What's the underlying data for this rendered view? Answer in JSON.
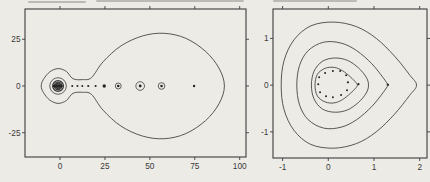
{
  "figure": {
    "background": "#edebe6",
    "ink": "#3c3c3c",
    "dot_color": "#262626",
    "label_color": "#3a3a3a",
    "panel_count": 2
  },
  "chart_data": [
    {
      "id": "left",
      "type": "contour+scatter",
      "title": "",
      "xlabel": "",
      "ylabel": "",
      "xlim": [
        -19.5,
        103.5
      ],
      "ylim": [
        -38.0,
        41.2
      ],
      "x_ticks": [
        0,
        25,
        50,
        75,
        100
      ],
      "y_ticks": [
        -25,
        0,
        25
      ],
      "grid": false,
      "legend": null,
      "contours": [
        {
          "name": "outer-lemniscate",
          "sw": 0.85,
          "points": [
            [
              7.2,
              3.9
            ],
            [
              3.5,
              7.8
            ],
            [
              -1.1,
              9.3
            ],
            [
              -5.8,
              7.5
            ],
            [
              -9.3,
              3.4
            ],
            [
              -10.5,
              0
            ],
            [
              -9.3,
              -3.4
            ],
            [
              -5.8,
              -7.5
            ],
            [
              -1.1,
              -9.3
            ],
            [
              3.5,
              -7.8
            ],
            [
              7.2,
              -3.9
            ],
            [
              12.5,
              -3.4
            ],
            [
              17.5,
              -4.5
            ],
            [
              24,
              -13
            ],
            [
              34,
              -21.5
            ],
            [
              46,
              -26.8
            ],
            [
              58,
              -28.2
            ],
            [
              70,
              -25.5
            ],
            [
              81,
              -18.5
            ],
            [
              88.5,
              -9.5
            ],
            [
              91.5,
              0
            ],
            [
              88.5,
              9.5
            ],
            [
              81,
              18.5
            ],
            [
              70,
              25.5
            ],
            [
              58,
              28.2
            ],
            [
              46,
              26.8
            ],
            [
              34,
              21.5
            ],
            [
              24,
              13
            ],
            [
              17.5,
              4.5
            ],
            [
              12.5,
              3.4
            ]
          ]
        }
      ],
      "circles": [
        {
          "c": [
            -1.1,
            0
          ],
          "r": 4.6,
          "sw": 0.8
        },
        {
          "c": [
            -1.1,
            0
          ],
          "r": 3.0,
          "sw": 1.3
        },
        {
          "c": [
            -1.1,
            0
          ],
          "r": 2.1,
          "sw": 1.3
        },
        {
          "c": [
            -1.1,
            0
          ],
          "r": 1.35,
          "sw": 1.4
        },
        {
          "c": [
            32.4,
            0
          ],
          "r": 1.65,
          "sw": 0.8
        },
        {
          "c": [
            44.6,
            0
          ],
          "r": 2.4,
          "sw": 0.8
        },
        {
          "c": [
            56.5,
            0
          ],
          "r": 1.85,
          "sw": 0.8
        }
      ],
      "filled": [
        {
          "c": [
            -1.3,
            0
          ],
          "rx": 2.9,
          "ry": 0.95
        }
      ],
      "points": [
        {
          "x": 6.8,
          "y": 0,
          "r": 1.0
        },
        {
          "x": 9.7,
          "y": 0,
          "r": 1.0
        },
        {
          "x": 12.4,
          "y": 0,
          "r": 1.0
        },
        {
          "x": 15.7,
          "y": 0,
          "r": 1.1
        },
        {
          "x": 19.8,
          "y": 0,
          "r": 1.1
        },
        {
          "x": 24.6,
          "y": 0,
          "r": 1.7
        },
        {
          "x": 32.4,
          "y": 0,
          "r": 1.3
        },
        {
          "x": 44.6,
          "y": 0,
          "r": 1.4
        },
        {
          "x": 56.5,
          "y": 0,
          "r": 1.3
        },
        {
          "x": 74.6,
          "y": 0,
          "r": 1.2
        }
      ]
    },
    {
      "id": "right",
      "type": "contour+scatter",
      "title": "",
      "xlabel": "",
      "ylabel": "",
      "xlim": [
        -1.21,
        2.16
      ],
      "ylim": [
        -1.56,
        1.63
      ],
      "x_ticks": [
        -1,
        0,
        1,
        2
      ],
      "y_ticks": [
        -1,
        0,
        1
      ],
      "grid": false,
      "legend": null,
      "contours": [
        {
          "name": "level-1-outer",
          "sw": 0.85,
          "points": [
            [
              -1.03,
              0
            ],
            [
              -0.97,
              0.52
            ],
            [
              -0.75,
              0.97
            ],
            [
              -0.38,
              1.27
            ],
            [
              0.12,
              1.35
            ],
            [
              0.62,
              1.25
            ],
            [
              1.05,
              1.0
            ],
            [
              1.45,
              0.62
            ],
            [
              1.78,
              0.22
            ],
            [
              1.93,
              0
            ],
            [
              1.78,
              -0.22
            ],
            [
              1.45,
              -0.62
            ],
            [
              1.05,
              -1.0
            ],
            [
              0.62,
              -1.25
            ],
            [
              0.12,
              -1.35
            ],
            [
              -0.38,
              -1.27
            ],
            [
              -0.75,
              -0.97
            ],
            [
              -0.97,
              -0.52
            ]
          ]
        },
        {
          "name": "level-2",
          "sw": 0.85,
          "points": [
            [
              -0.69,
              0
            ],
            [
              -0.63,
              0.42
            ],
            [
              -0.44,
              0.74
            ],
            [
              -0.1,
              0.92
            ],
            [
              0.28,
              0.9
            ],
            [
              0.62,
              0.74
            ],
            [
              0.95,
              0.46
            ],
            [
              1.2,
              0.16
            ],
            [
              1.31,
              0
            ],
            [
              1.31,
              0
            ],
            [
              1.2,
              -0.16
            ],
            [
              0.95,
              -0.46
            ],
            [
              0.62,
              -0.74
            ],
            [
              0.28,
              -0.9
            ],
            [
              -0.1,
              -0.92
            ],
            [
              -0.44,
              -0.74
            ],
            [
              -0.63,
              -0.42
            ]
          ]
        },
        {
          "name": "level-3",
          "sw": 0.85,
          "points": [
            [
              -0.37,
              0
            ],
            [
              -0.31,
              0.3
            ],
            [
              -0.13,
              0.51
            ],
            [
              0.14,
              0.58
            ],
            [
              0.42,
              0.53
            ],
            [
              0.66,
              0.37
            ],
            [
              0.83,
              0.17
            ],
            [
              0.88,
              0
            ],
            [
              0.83,
              -0.17
            ],
            [
              0.66,
              -0.37
            ],
            [
              0.42,
              -0.53
            ],
            [
              0.14,
              -0.58
            ],
            [
              -0.13,
              -0.51
            ],
            [
              -0.31,
              -0.3
            ]
          ]
        },
        {
          "name": "level-4-inner",
          "sw": 0.85,
          "points": [
            [
              -0.29,
              0
            ],
            [
              -0.24,
              0.23
            ],
            [
              -0.07,
              0.36
            ],
            [
              0.13,
              0.38
            ],
            [
              0.31,
              0.31
            ],
            [
              0.48,
              0.18
            ],
            [
              0.61,
              0.05
            ],
            [
              0.64,
              0
            ],
            [
              0.64,
              0
            ],
            [
              0.61,
              -0.05
            ],
            [
              0.48,
              -0.18
            ],
            [
              0.31,
              -0.31
            ],
            [
              0.13,
              -0.38
            ],
            [
              -0.07,
              -0.36
            ],
            [
              -0.24,
              -0.23
            ]
          ]
        }
      ],
      "circles": [],
      "filled": [],
      "points": [
        {
          "x": -0.07,
          "y": 0.26,
          "r": 1.0
        },
        {
          "x": 0.1,
          "y": 0.3,
          "r": 1.0
        },
        {
          "x": 0.26,
          "y": 0.3,
          "r": 1.0
        },
        {
          "x": 0.39,
          "y": 0.21,
          "r": 1.0
        },
        {
          "x": 0.43,
          "y": 0.06,
          "r": 1.1
        },
        {
          "x": 0.41,
          "y": -0.11,
          "r": 1.0
        },
        {
          "x": 0.28,
          "y": -0.21,
          "r": 1.0
        },
        {
          "x": 0.1,
          "y": -0.26,
          "r": 1.0
        },
        {
          "x": -0.05,
          "y": -0.24,
          "r": 1.0
        },
        {
          "x": -0.18,
          "y": -0.15,
          "r": 1.0
        },
        {
          "x": -0.22,
          "y": 0.02,
          "r": 1.0
        },
        {
          "x": -0.2,
          "y": 0.17,
          "r": 1.0
        },
        {
          "x": 0.66,
          "y": 0.02,
          "r": 1.1
        },
        {
          "x": 1.3,
          "y": 0.01,
          "r": 1.1
        }
      ]
    }
  ]
}
